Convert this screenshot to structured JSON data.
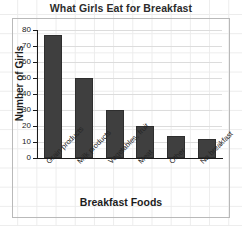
{
  "chart_data": {
    "type": "bar",
    "title": "What Girls Eat for Breakfast",
    "xlabel": "Breakfast Foods",
    "ylabel": "Number of Girls",
    "categories": [
      "Grain products",
      "Milk products",
      "Vegetables, fruit",
      "Meat",
      "Other",
      "No breakfast"
    ],
    "values": [
      77,
      50,
      30,
      20,
      14,
      12
    ],
    "ylim": [
      0,
      80
    ],
    "yticks": [
      0,
      10,
      20,
      30,
      40,
      50,
      60,
      70,
      80
    ],
    "ytick_labels": [
      "0",
      "10",
      "20",
      "30",
      "40",
      "50",
      "60",
      "70",
      "80"
    ],
    "grid": true,
    "grid_axis": "y",
    "legend": false,
    "bar_color": "#3f3f3f",
    "background_color": "#ffffff",
    "grid_color": "#dcdcdc"
  }
}
